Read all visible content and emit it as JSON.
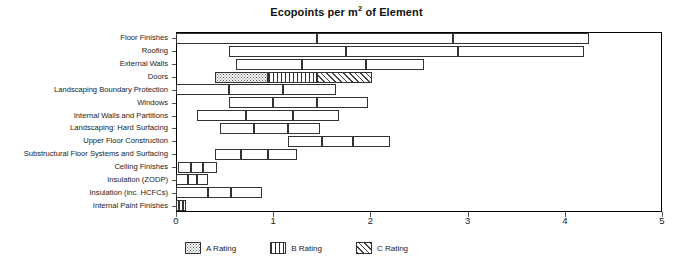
{
  "chart_data": {
    "type": "bar",
    "title": "Ecopoints per m2 of Element",
    "title_prefix": "Ecopoints per m",
    "title_sup": "2",
    "title_suffix": " of Element",
    "xlabel": "",
    "ylabel": "",
    "xlim": [
      0,
      5
    ],
    "xticks": [
      0,
      1,
      2,
      3,
      4,
      5
    ],
    "xticklabels": [
      "0",
      "1",
      "2",
      "3",
      "4",
      "5"
    ],
    "grid": false,
    "orientation": "horizontal",
    "stacked": true,
    "legend_position": "bottom",
    "categories": [
      "Floor Finishes",
      "Roofing",
      "External Walls",
      "Doors",
      "Landscaping Boundary Protection",
      "Windows",
      "Internal Walls and Partitions",
      "Landscaping: Hard Surfacing",
      "Upper Floor Construction",
      "Substructural Floor Systems and Surfacing",
      "Ceiling Finishes",
      "Insulation (ZODP)",
      "Insulation (inc. HCFCs)",
      "Internal Paint Finishes"
    ],
    "series": [
      {
        "name": "A Rating",
        "pattern": "dots"
      },
      {
        "name": "B Rating",
        "pattern": "vertical-lines"
      },
      {
        "name": "C Rating",
        "pattern": "diagonal-hatch"
      }
    ],
    "bars": [
      {
        "category": "Floor Finishes",
        "start": 0.0,
        "breaks": [
          1.45,
          2.85
        ],
        "end": 4.25,
        "filled": false
      },
      {
        "category": "Roofing",
        "start": 0.55,
        "breaks": [
          1.75,
          2.9
        ],
        "end": 4.2,
        "filled": false
      },
      {
        "category": "External Walls",
        "start": 0.62,
        "breaks": [
          1.3,
          1.95
        ],
        "end": 2.55,
        "filled": false
      },
      {
        "category": "Doors",
        "start": 0.4,
        "breaks": [
          0.95,
          1.45
        ],
        "end": 2.02,
        "filled": true
      },
      {
        "category": "Landscaping Boundary Protection",
        "start": 0.0,
        "breaks": [
          0.55,
          1.1
        ],
        "end": 1.65,
        "filled": false
      },
      {
        "category": "Windows",
        "start": 0.55,
        "breaks": [
          1.0,
          1.45
        ],
        "end": 1.98,
        "filled": false
      },
      {
        "category": "Internal Walls and Partitions",
        "start": 0.22,
        "breaks": [
          0.72,
          1.2
        ],
        "end": 1.68,
        "filled": false
      },
      {
        "category": "Landscaping: Hard Surfacing",
        "start": 0.45,
        "breaks": [
          0.8,
          1.15
        ],
        "end": 1.48,
        "filled": false
      },
      {
        "category": "Upper Floor Construction",
        "start": 1.15,
        "breaks": [
          1.5,
          1.82
        ],
        "end": 2.2,
        "filled": false
      },
      {
        "category": "Substructural Floor Systems and Surfacing",
        "start": 0.4,
        "breaks": [
          0.67,
          0.95
        ],
        "end": 1.25,
        "filled": false
      },
      {
        "category": "Ceiling Finishes",
        "start": 0.02,
        "breaks": [
          0.15,
          0.28
        ],
        "end": 0.42,
        "filled": false
      },
      {
        "category": "Insulation (ZODP)",
        "start": 0.0,
        "breaks": [
          0.12,
          0.22
        ],
        "end": 0.33,
        "filled": false
      },
      {
        "category": "Insulation (inc. HCFCs)",
        "start": 0.0,
        "breaks": [
          0.33,
          0.57
        ],
        "end": 0.88,
        "filled": false
      },
      {
        "category": "Internal Paint Finishes",
        "start": 0.0,
        "breaks": [
          0.035,
          0.07
        ],
        "end": 0.105,
        "filled": false
      }
    ]
  },
  "legend": {
    "items": [
      {
        "label": "A Rating",
        "pattern": "A"
      },
      {
        "label": "B Rating",
        "pattern": "B"
      },
      {
        "label": "C Rating",
        "pattern": "C"
      }
    ]
  },
  "colors": {
    "axis": "#000000",
    "bar_outline": "#333333",
    "text": "#1a1a1a",
    "background": "#ffffff"
  }
}
